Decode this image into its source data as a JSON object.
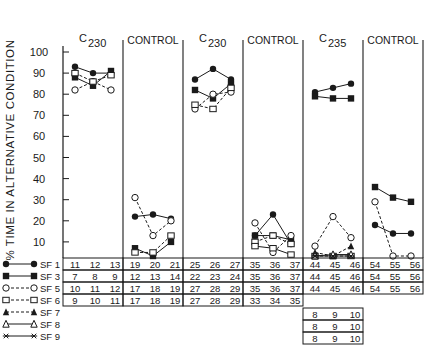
{
  "chart_data": {
    "type": "line",
    "ylabel": "% TIME IN ALTERNATIVE CONDITION",
    "yticks": [
      10,
      20,
      30,
      40,
      50,
      60,
      70,
      80,
      90,
      100
    ],
    "ylim": [
      0,
      100
    ],
    "grid": false,
    "legend_position": "bottom-left",
    "panels": [
      {
        "label": "C230",
        "label_main": "C",
        "label_sub": "230",
        "series": {
          "SF1": [
            93,
            90,
            90
          ],
          "SF3": [
            88,
            84,
            91
          ],
          "SF5": [
            82,
            86,
            82
          ],
          "SF6": [
            90,
            86,
            89
          ]
        }
      },
      {
        "label": "CONTROL",
        "series": {
          "SF1": [
            22,
            23,
            21
          ],
          "SF3": [
            7,
            0,
            10
          ],
          "SF5": [
            31,
            13,
            20
          ],
          "SF6": [
            5,
            5,
            13
          ]
        }
      },
      {
        "label": "C230",
        "label_main": "C",
        "label_sub": "230",
        "series": {
          "SF1": [
            87,
            92,
            87
          ],
          "SF3": [
            82,
            78,
            85
          ],
          "SF5": [
            73,
            80,
            81
          ],
          "SF6": [
            75,
            73,
            83
          ]
        }
      },
      {
        "label": "CONTROL",
        "series": {
          "SF1": [
            13,
            23,
            9
          ],
          "SF3": [
            13,
            13,
            11
          ],
          "SF5": [
            19,
            5,
            13
          ],
          "SF6": [
            10,
            13,
            9
          ],
          "SF6b": [
            8,
            7,
            4
          ]
        }
      },
      {
        "label": "C235",
        "label_main": "C",
        "label_sub": "235",
        "series": {
          "SF1": [
            81,
            83,
            85
          ],
          "SF3": [
            79,
            78,
            78
          ],
          "SF5": [
            8,
            22,
            12
          ],
          "SF6": [
            1,
            2,
            3
          ],
          "SF7": [
            5,
            2,
            8
          ],
          "SF8": [
            1,
            4,
            4
          ],
          "SF9": [
            0,
            0,
            1
          ]
        }
      },
      {
        "label": "CONTROL",
        "series": {
          "SF1": [
            18,
            14,
            14
          ],
          "SF3": [
            36,
            31,
            29
          ],
          "SF5": [
            29,
            0,
            3
          ]
        }
      }
    ],
    "legend": [
      {
        "name": "SF 1",
        "marker": "filled-circle",
        "line": "solid"
      },
      {
        "name": "SF 3",
        "marker": "filled-square",
        "line": "solid"
      },
      {
        "name": "SF 5",
        "marker": "open-circle",
        "line": "dashed"
      },
      {
        "name": "SF 6",
        "marker": "open-square",
        "line": "dashed"
      },
      {
        "name": "SF 7",
        "marker": "filled-triangle",
        "line": "dashed"
      },
      {
        "name": "SF 8",
        "marker": "open-triangle",
        "line": "solid"
      },
      {
        "name": "SF 9",
        "marker": "asterisk",
        "line": "solid"
      }
    ],
    "session_table": {
      "rows": [
        {
          "subject": "SF 1",
          "sessions": [
            [
              11,
              12,
              13
            ],
            [
              19,
              20,
              21
            ],
            [
              25,
              26,
              27
            ],
            [
              35,
              36,
              37
            ],
            [
              44,
              45,
              46
            ],
            [
              54,
              55,
              56
            ]
          ]
        },
        {
          "subject": "SF 3",
          "sessions": [
            [
              7,
              8,
              9
            ],
            [
              12,
              13,
              14
            ],
            [
              22,
              23,
              24
            ],
            [
              35,
              36,
              37
            ],
            [
              44,
              45,
              46
            ],
            [
              54,
              55,
              56
            ]
          ]
        },
        {
          "subject": "SF 5",
          "sessions": [
            [
              10,
              11,
              12
            ],
            [
              17,
              18,
              19
            ],
            [
              27,
              28,
              29
            ],
            [
              35,
              36,
              37
            ],
            [
              44,
              45,
              46
            ],
            [
              54,
              55,
              56
            ]
          ]
        },
        {
          "subject": "SF 6",
          "sessions": [
            [
              9,
              10,
              11
            ],
            [
              17,
              18,
              19
            ],
            [
              27,
              28,
              29
            ],
            [
              33,
              34,
              35
            ],
            [],
            []
          ]
        },
        {
          "subject": "SF 7",
          "sessions": [
            [],
            [],
            [],
            [],
            [
              8,
              9,
              10
            ],
            []
          ]
        },
        {
          "subject": "SF 8",
          "sessions": [
            [],
            [],
            [],
            [],
            [
              8,
              9,
              10
            ],
            []
          ]
        },
        {
          "subject": "SF 9",
          "sessions": [
            [],
            [],
            [],
            [],
            [
              8,
              9,
              10
            ],
            []
          ]
        }
      ]
    }
  }
}
